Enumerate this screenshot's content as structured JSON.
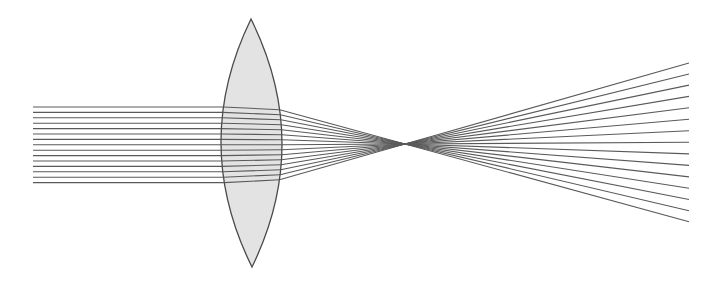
{
  "diagram": {
    "type": "optics-ray-diagram",
    "colors": {
      "background": "#ffffff",
      "lens_fill": "#e3e3e3",
      "lens_stroke": "#4a4a4a",
      "ray": "#5a5a5a"
    },
    "lens": {
      "kind": "biconvex",
      "top": [
        251,
        19
      ],
      "bottom": [
        252,
        267
      ],
      "left_extent_x": 221,
      "right_extent_x": 282,
      "center_y": 143
    },
    "rays": {
      "count": 15,
      "start_x": 33,
      "end_x": 689,
      "incoming_y": [
        107,
        112.4,
        117.8,
        123.2,
        128.6,
        134,
        139.4,
        144.8,
        150.2,
        155.6,
        161,
        166.4,
        171.8,
        177.2,
        182.6
      ],
      "lens_shift": 3,
      "direction": "left-to-right"
    },
    "focal_point": [
      405,
      144
    ]
  }
}
